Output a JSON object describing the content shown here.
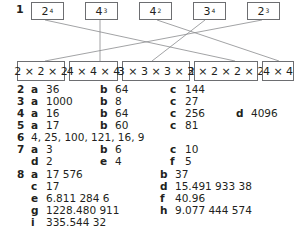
{
  "q1": {
    "number": "1",
    "powers": [
      {
        "base": "2",
        "exp": "4"
      },
      {
        "base": "4",
        "exp": "3"
      },
      {
        "base": "4",
        "exp": "2"
      },
      {
        "base": "3",
        "exp": "4"
      },
      {
        "base": "2",
        "exp": "3"
      }
    ],
    "products": [
      "2 × 2 × 2",
      "4 × 4 × 4",
      "3 × 3 × 3 × 3",
      "2 × 2 × 2 × 2",
      "4 × 4"
    ],
    "matches": [
      {
        "power": 0,
        "product": 3
      },
      {
        "power": 1,
        "product": 1
      },
      {
        "power": 2,
        "product": 4
      },
      {
        "power": 3,
        "product": 2
      },
      {
        "power": 4,
        "product": 0
      }
    ]
  },
  "answers": {
    "q2": {
      "number": "2",
      "a": "36",
      "b": "64",
      "c": "144"
    },
    "q3": {
      "number": "3",
      "a": "1000",
      "b": "8",
      "c": "27"
    },
    "q4": {
      "number": "4",
      "a": "16",
      "b": "64",
      "c": "256",
      "d": "4096"
    },
    "q5": {
      "number": "5",
      "a": "17",
      "b": "60",
      "c": "81"
    },
    "q6": {
      "number": "6",
      "text": "4, 25, 100, 121, 16, 9"
    },
    "q7": {
      "number": "7",
      "a": "3",
      "b": "6",
      "c": "10",
      "d": "2",
      "e": "4",
      "f": "5"
    },
    "q8": {
      "number": "8",
      "a": "17 576",
      "b": "37",
      "c": "17",
      "d": "15.491 933 38",
      "e": "6.811 284 6",
      "f": "40.96",
      "g": "1228.480 911",
      "h": "9.077 444 574",
      "i": "335.544 32"
    }
  },
  "labels": {
    "a": "a",
    "b": "b",
    "c": "c",
    "d": "d",
    "e": "e",
    "f": "f",
    "g": "g",
    "h": "h",
    "i": "i"
  }
}
